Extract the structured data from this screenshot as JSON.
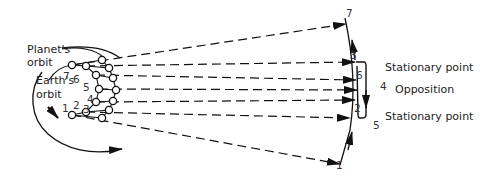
{
  "diagram": {
    "labels": {
      "planet_orbit": "Planet's",
      "planet_orbit_2": "orbit",
      "earth_orbit": "Earth's",
      "earth_orbit_2": "orbit",
      "stationary_top": "Stationary point",
      "opposition": "Opposition",
      "stationary_bottom": "Stationary point"
    },
    "earth_positions": [
      "1",
      "2",
      "3",
      "4",
      "5",
      "6",
      "7"
    ],
    "sky_positions": {
      "p7": "7",
      "p3": "3",
      "p6": "6",
      "p4": "4",
      "p2": "2",
      "p5": "5",
      "p1": "1"
    },
    "earth_numbers": {
      "e7": "7",
      "e6": "6",
      "e5": "5",
      "e4": "4",
      "e3": "3",
      "e2": "2",
      "e1": "1"
    }
  }
}
